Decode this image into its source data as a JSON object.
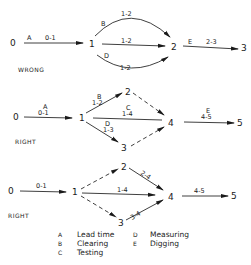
{
  "diagrams": [
    {
      "verdict": "WRONG",
      "nodes": [
        "0",
        "1",
        "2",
        "3"
      ],
      "arrows": [
        {
          "letter": "A",
          "label": "0-1"
        },
        {
          "letter": "B",
          "label": "1-2"
        },
        {
          "letter": "",
          "label": "1-2"
        },
        {
          "letter": "D",
          "label": "1-2"
        },
        {
          "letter": "E",
          "label": "2-3"
        }
      ]
    },
    {
      "verdict": "RIGHT",
      "nodes": [
        "0",
        "1",
        "2",
        "3",
        "4",
        "5"
      ],
      "arrows": [
        {
          "letter": "A",
          "label": "0-1"
        },
        {
          "letter": "B",
          "label": "1-2"
        },
        {
          "letter": "C",
          "label": "1-4"
        },
        {
          "letter": "D",
          "label": "1-3"
        },
        {
          "letter": "E",
          "label": "4-5"
        }
      ]
    },
    {
      "verdict": "RIGHT",
      "nodes": [
        "0",
        "1",
        "2",
        "3",
        "4",
        "5"
      ],
      "arrows": [
        {
          "label": "0-1"
        },
        {
          "label": "1-4"
        },
        {
          "label": "2-4"
        },
        {
          "label": "3-4"
        },
        {
          "label": "4-5"
        }
      ]
    }
  ],
  "legend": [
    {
      "key": "A",
      "text": "Lead time"
    },
    {
      "key": "B",
      "text": "Clearing"
    },
    {
      "key": "C",
      "text": "Testing"
    },
    {
      "key": "D",
      "text": "Measuring"
    },
    {
      "key": "E",
      "text": "Digging"
    }
  ]
}
